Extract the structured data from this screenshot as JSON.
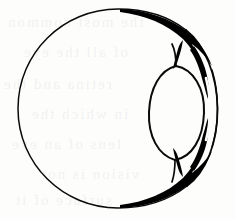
{
  "figure": {
    "title": "Sagittal line drawing of the human eyeball",
    "style": "ink line drawing, black on white",
    "width": 235,
    "height": 219,
    "background_color": "#fdfdfc",
    "ink_color": "#000000"
  },
  "parts": [
    {
      "id": "globe",
      "label": "Sclera / globe outline",
      "shape": "circle",
      "center_x": 117.5,
      "center_y": 108.5,
      "radius_x": 100.5,
      "radius_y": 99.5,
      "stroke_min": 1.1,
      "stroke_max": 2.2
    },
    {
      "id": "cornea",
      "label": "Cornea / anterior bulge",
      "shape": "oval",
      "center_x": 177,
      "center_y": 113,
      "radius_x": 28,
      "radius_y": 47,
      "stroke": 2.0
    },
    {
      "id": "limbus-upper",
      "label": "Upper limbal thickening",
      "shape": "tapered-crescent",
      "position": "upper-right"
    },
    {
      "id": "limbus-lower",
      "label": "Lower limbal thickening",
      "shape": "tapered-crescent",
      "position": "lower-right"
    },
    {
      "id": "anterior-chamber-gap",
      "label": "Gap between cornea and scleral rim",
      "shape": "thin-white-channel",
      "position": "right"
    }
  ],
  "bleed_through": {
    "visible": true,
    "description": "very faint mirrored text from the reverse side of the page",
    "opacity": 0.05,
    "lines": [
      "the most common",
      "of all the eye",
      "retina and the",
      "in which the",
      "lens of an eye",
      "vision is not",
      "surface of it"
    ]
  }
}
